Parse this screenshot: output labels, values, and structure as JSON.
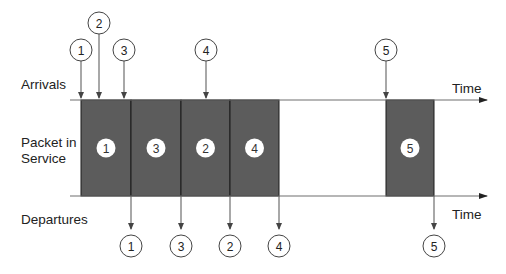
{
  "labels": {
    "arrivals": "Arrivals",
    "packet_line1": "Packet in",
    "packet_line2": "Service",
    "departures": "Departures",
    "time_top": "Time",
    "time_bottom": "Time"
  },
  "colors": {
    "box_fill": "#5c5c5c",
    "line": "#6e6e6e",
    "circle_stroke": "#444444",
    "text": "#222222"
  },
  "arrivals": [
    {
      "id": "1",
      "x": 81,
      "cy": 50
    },
    {
      "id": "2",
      "x": 99,
      "cy": 23
    },
    {
      "id": "3",
      "x": 124,
      "cy": 50
    },
    {
      "id": "4",
      "x": 206,
      "cy": 50
    },
    {
      "id": "5",
      "x": 386,
      "cy": 50
    }
  ],
  "service": [
    {
      "id": "1",
      "x0": 81,
      "x1": 131
    },
    {
      "id": "3",
      "x0": 131,
      "x1": 181
    },
    {
      "id": "2",
      "x0": 181,
      "x1": 230
    },
    {
      "id": "4",
      "x0": 230,
      "x1": 279
    },
    {
      "id": "5",
      "x0": 386,
      "x1": 434
    }
  ],
  "departures": [
    {
      "id": "1",
      "x": 131
    },
    {
      "id": "3",
      "x": 181
    },
    {
      "id": "2",
      "x": 230
    },
    {
      "id": "4",
      "x": 279
    },
    {
      "id": "5",
      "x": 434
    }
  ]
}
